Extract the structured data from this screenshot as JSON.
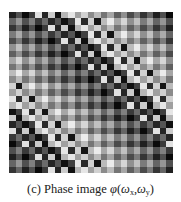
{
  "figure": {
    "label": "(c)",
    "caption_text": "Phase image",
    "caption_symbol": "φ",
    "caption_args": {
      "open": "(",
      "var1": "ω",
      "sub1": "x",
      "sep": ",",
      "var2": "ω",
      "sub2": "y",
      "close": ")"
    }
  },
  "phase_image": {
    "description": "Wrapped phase map shown as grayscale checkerboard with diagonal phase-wrap bands",
    "grid_cells": 25,
    "colormap": "grayscale",
    "dark_color": "#050505",
    "light_color": "#f2f2f2"
  }
}
